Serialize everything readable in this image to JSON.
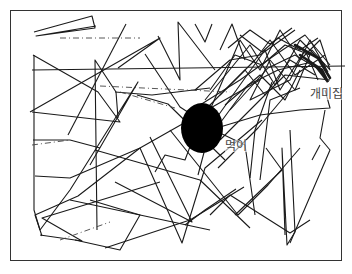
{
  "figure": {
    "labels": {
      "nest": "개미집",
      "food": "먹이"
    },
    "colors": {
      "line": "#1a1a1a",
      "food_blob": "#000000",
      "frame": "#333333",
      "background": "#ffffff"
    },
    "food_blob": {
      "cx": 202,
      "cy": 128,
      "rx": 21,
      "ry": 25
    }
  }
}
